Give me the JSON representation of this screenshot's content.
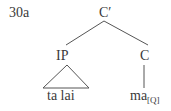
{
  "example_number": "30a",
  "tree": {
    "root": {
      "label": "C′"
    },
    "left_child": {
      "label": "IP",
      "terminal": "ta lai",
      "triangle": true
    },
    "right_child": {
      "label": "C",
      "terminal": "ma",
      "terminal_subscript": "[Q]"
    }
  },
  "colors": {
    "ink": "#3a3a3a",
    "background": "#ffffff"
  }
}
